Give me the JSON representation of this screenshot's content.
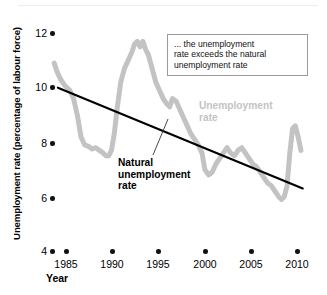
{
  "figure": {
    "name": "unemployment-rate-vs-natural-rate-chart"
  },
  "axes": {
    "y_title": "Unemployment rate (percentage of labour force)",
    "x_title": "Year",
    "y_ticks": [
      "12",
      "10",
      "8",
      "6",
      "4"
    ],
    "x_ticks": [
      "1985",
      "1990",
      "1995",
      "2000",
      "2005",
      "2010"
    ]
  },
  "callout": {
    "line1": "... the unemployment",
    "line2": "rate exceeds the natural",
    "line3": "unemployment rate"
  },
  "labels": {
    "unemployment_line1": "Unemployment",
    "unemployment_line2": "rate",
    "natural_line1": "Natural",
    "natural_line2": "unemployment",
    "natural_line3": "rate"
  },
  "colors": {
    "unemployment_series": "#c3c3c3",
    "natural_series": "#000000",
    "callout_border": "#9a9a9a",
    "background": "#ffffff"
  },
  "chart_data": {
    "type": "line",
    "title": "",
    "xlabel": "Year",
    "ylabel": "Unemployment rate (percentage of labour force)",
    "xlim": [
      1983.6,
      2010.8
    ],
    "ylim": [
      4,
      12.6
    ],
    "grid": false,
    "legend": "inline-annotations",
    "yticks": [
      4,
      6,
      8,
      10,
      12
    ],
    "xticks": [
      1985,
      1990,
      1995,
      2000,
      2005,
      2010
    ],
    "series": [
      {
        "name": "Unemployment rate",
        "color": "#c3c3c3",
        "x": [
          1983.7,
          1984.0,
          1984.4,
          1984.8,
          1985.1,
          1985.4,
          1985.8,
          1986.2,
          1986.6,
          1987.0,
          1987.4,
          1987.8,
          1988.2,
          1988.6,
          1989.0,
          1989.3,
          1989.6,
          1989.9,
          1990.2,
          1990.5,
          1990.9,
          1991.3,
          1991.7,
          1992.1,
          1992.4,
          1992.7,
          1993.0,
          1993.3,
          1993.6,
          1993.9,
          1994.3,
          1994.7,
          1995.1,
          1995.5,
          1995.9,
          1996.2,
          1996.5,
          1996.9,
          1997.3,
          1997.7,
          1998.1,
          1998.5,
          1998.9,
          1999.3,
          1999.7,
          2000.0,
          2000.4,
          2000.8,
          2001.2,
          2001.6,
          2002.0,
          2002.4,
          2002.8,
          2003.2,
          2003.6,
          2004.0,
          2004.4,
          2004.8,
          2005.2,
          2005.6,
          2006.0,
          2006.4,
          2006.8,
          2007.2,
          2007.6,
          2008.0,
          2008.3,
          2008.6,
          2008.9,
          2009.2,
          2009.5,
          2009.8,
          2010.1,
          2010.4
        ],
        "y": [
          10.9,
          10.6,
          10.3,
          10.1,
          10.0,
          9.9,
          9.6,
          9.0,
          8.2,
          7.9,
          7.85,
          7.75,
          7.8,
          7.7,
          7.6,
          7.5,
          7.5,
          7.7,
          8.3,
          9.2,
          10.2,
          10.7,
          11.0,
          11.3,
          11.6,
          11.7,
          11.5,
          11.7,
          11.4,
          11.2,
          10.7,
          10.2,
          9.9,
          9.6,
          9.4,
          9.3,
          9.6,
          9.5,
          9.2,
          8.9,
          8.6,
          8.3,
          8.1,
          7.9,
          7.6,
          7.0,
          6.8,
          6.9,
          7.2,
          7.4,
          7.6,
          7.8,
          7.6,
          7.5,
          7.7,
          7.8,
          7.6,
          7.4,
          7.2,
          7.1,
          6.9,
          6.7,
          6.5,
          6.4,
          6.2,
          6.0,
          5.9,
          6.0,
          6.4,
          7.6,
          8.5,
          8.6,
          8.2,
          7.7
        ]
      },
      {
        "name": "Natural unemployment rate",
        "color": "#000000",
        "x": [
          1984.1,
          2010.6
        ],
        "y": [
          10.0,
          6.3
        ]
      }
    ]
  }
}
